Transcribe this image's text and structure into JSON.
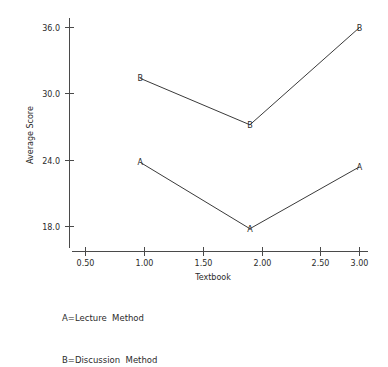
{
  "chart_data": {
    "type": "line",
    "title": "",
    "xlabel": "Textbook",
    "ylabel": "Average Score",
    "x": [
      1.0,
      2.0,
      3.0
    ],
    "xlim": [
      0.5,
      3.1
    ],
    "ylim": [
      15.8,
      37.2
    ],
    "grid": false,
    "legend_position": "below-plot",
    "xticks": [
      "0.50",
      "1.00",
      "1.50",
      "2.00",
      "2.50",
      "3.00"
    ],
    "xtick_values": [
      0.5,
      1.0,
      1.5,
      2.0,
      2.5,
      3.0
    ],
    "yticks": [
      "18.0",
      "24.0",
      "30.0",
      "36.0"
    ],
    "ytick_values": [
      18.0,
      24.0,
      30.0,
      36.0
    ],
    "series": [
      {
        "name": "A",
        "marker": "A",
        "legend": "A=Lecture  Method",
        "values": [
          23.8,
          17.8,
          23.4
        ]
      },
      {
        "name": "B",
        "marker": "B",
        "legend": "B=Discussion  Method",
        "values": [
          31.4,
          27.2,
          36.0
        ]
      }
    ],
    "annotations": []
  },
  "legend": {
    "lines": [
      "A=Lecture  Method",
      "B=Discussion  Method"
    ]
  },
  "axes": {
    "y_title": "Average Score",
    "x_title": "Textbook",
    "y_tick_labels": [
      "36.0",
      "30.0",
      "24.0",
      "18.0"
    ],
    "x_tick_labels": [
      "0.50",
      "1.00",
      "1.50",
      "2.00",
      "2.50",
      "3.00"
    ]
  },
  "colors": {
    "axis": "#4a4a4a",
    "series_line": "#3a3a3a",
    "text": "#2b2b2b",
    "background": "#ffffff"
  }
}
